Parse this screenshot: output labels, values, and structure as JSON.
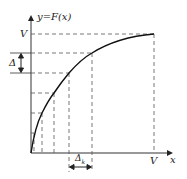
{
  "diagram": {
    "y_axis_label": "y=F(x)",
    "x_axis_label": "x",
    "y_top_label": "V",
    "x_right_label": "V",
    "delta_label": "Δ",
    "delta_k_label": "Δ",
    "delta_k_sub": "k",
    "colors": {
      "curve": "#111111",
      "axes": "#333333",
      "dashed": "#555555"
    }
  }
}
